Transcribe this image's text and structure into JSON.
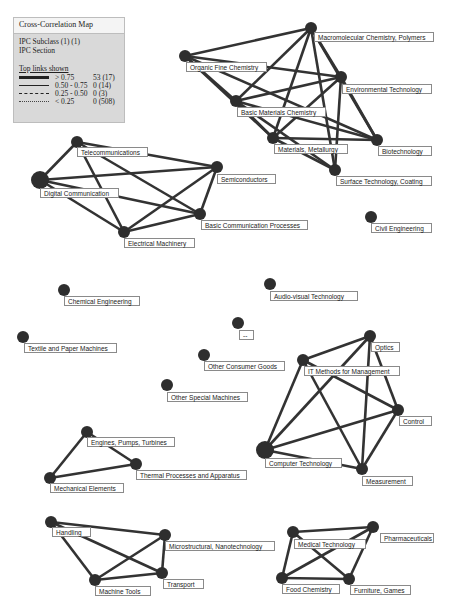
{
  "legend": {
    "title": "Cross-Correlation Map",
    "line1": "IPC Subclass (1) (1)",
    "line2": "IPC Section",
    "top_links_label": "Top links shown",
    "rows": [
      {
        "range": "> 0.75",
        "count": "53 (17)",
        "style": "thick"
      },
      {
        "range": "0.50 - 0.75",
        "count": "0 (14)",
        "style": "thin"
      },
      {
        "range": "0.25 - 0.50",
        "count": "0 (3)",
        "style": "dashed"
      },
      {
        "range": "< 0.25",
        "count": "0 (508)",
        "style": "dotted"
      }
    ]
  },
  "colors": {
    "node": "#2e2e2e",
    "edge": "#333333",
    "background": "#ffffff"
  },
  "nodes": [
    {
      "id": "macro",
      "label": "Macromolecular Chemistry, Polymers",
      "x": 311,
      "y": 28,
      "r": 6,
      "lx": 314,
      "ly": 32,
      "lw": 120
    },
    {
      "id": "organic",
      "label": "Organic Fine Chemistry",
      "x": 185,
      "y": 56,
      "r": 6,
      "lx": 186,
      "ly": 62,
      "lw": 81
    },
    {
      "id": "env",
      "label": "Environmental Technology",
      "x": 341,
      "y": 77,
      "r": 6,
      "lx": 342,
      "ly": 84,
      "lw": 90
    },
    {
      "id": "basicmat",
      "label": "Basic Materials Chemistry",
      "x": 236,
      "y": 101,
      "r": 6,
      "lx": 237,
      "ly": 107,
      "lw": 89
    },
    {
      "id": "metal",
      "label": "Materials, Metallurgy",
      "x": 273,
      "y": 138,
      "r": 6,
      "lx": 274,
      "ly": 144,
      "lw": 74
    },
    {
      "id": "biotech",
      "label": "Biotechnology",
      "x": 377,
      "y": 140,
      "r": 6,
      "lx": 378,
      "ly": 146,
      "lw": 54
    },
    {
      "id": "surface",
      "label": "Surface Technology, Coating",
      "x": 335,
      "y": 170,
      "r": 6,
      "lx": 336,
      "ly": 176,
      "lw": 96
    },
    {
      "id": "telecom",
      "label": "Telecommunications",
      "x": 77,
      "y": 142,
      "r": 6,
      "lx": 77,
      "ly": 147,
      "lw": 71
    },
    {
      "id": "digital",
      "label": "Digital Communication",
      "x": 40,
      "y": 180,
      "r": 9,
      "lx": 40,
      "ly": 188,
      "lw": 79
    },
    {
      "id": "semi",
      "label": "Semiconductors",
      "x": 217,
      "y": 167,
      "r": 6,
      "lx": 217,
      "ly": 174,
      "lw": 59
    },
    {
      "id": "basiccomm",
      "label": "Basic Communication Processes",
      "x": 200,
      "y": 214,
      "r": 6,
      "lx": 201,
      "ly": 220,
      "lw": 107
    },
    {
      "id": "elec",
      "label": "Electrical Machinery",
      "x": 124,
      "y": 232,
      "r": 6,
      "lx": 124,
      "ly": 238,
      "lw": 71
    },
    {
      "id": "civil",
      "label": "Civil Engineering",
      "x": 371,
      "y": 217,
      "r": 6,
      "lx": 371,
      "ly": 223,
      "lw": 61
    },
    {
      "id": "chem",
      "label": "Chemical Engineering",
      "x": 64,
      "y": 290,
      "r": 6,
      "lx": 64,
      "ly": 296,
      "lw": 76
    },
    {
      "id": "av",
      "label": "Audio-visual Technology",
      "x": 270,
      "y": 284,
      "r": 6,
      "lx": 270,
      "ly": 291,
      "lw": 88
    },
    {
      "id": "dash",
      "label": "--",
      "x": 238,
      "y": 323,
      "r": 6,
      "lx": 239,
      "ly": 330,
      "lw": 15
    },
    {
      "id": "textile",
      "label": "Textile and Paper Machines",
      "x": 23,
      "y": 337,
      "r": 6,
      "lx": 24,
      "ly": 343,
      "lw": 93
    },
    {
      "id": "optics",
      "label": "Optics",
      "x": 370,
      "y": 336,
      "r": 6,
      "lx": 371,
      "ly": 342,
      "lw": 29
    },
    {
      "id": "consumer",
      "label": "Other Consumer Goods",
      "x": 204,
      "y": 355,
      "r": 6,
      "lx": 204,
      "ly": 361,
      "lw": 81
    },
    {
      "id": "itmeth",
      "label": "IT Methods for Management",
      "x": 303,
      "y": 360,
      "r": 6,
      "lx": 304,
      "ly": 366,
      "lw": 96
    },
    {
      "id": "special",
      "label": "Other Special Machines",
      "x": 167,
      "y": 385,
      "r": 6,
      "lx": 167,
      "ly": 392,
      "lw": 81
    },
    {
      "id": "control",
      "label": "Control",
      "x": 398,
      "y": 410,
      "r": 6,
      "lx": 399,
      "ly": 416,
      "lw": 33
    },
    {
      "id": "engines",
      "label": "Engines, Pumps, Turbines",
      "x": 87,
      "y": 432,
      "r": 6,
      "lx": 87,
      "ly": 437,
      "lw": 88
    },
    {
      "id": "computer",
      "label": "Computer Technology",
      "x": 265,
      "y": 450,
      "r": 9,
      "lx": 265,
      "ly": 458,
      "lw": 77
    },
    {
      "id": "thermal",
      "label": "Thermal Processes and Apparatus",
      "x": 136,
      "y": 464,
      "r": 6,
      "lx": 136,
      "ly": 470,
      "lw": 111
    },
    {
      "id": "measure",
      "label": "Measurement",
      "x": 362,
      "y": 469,
      "r": 6,
      "lx": 362,
      "ly": 476,
      "lw": 51
    },
    {
      "id": "mech",
      "label": "Mechanical Elements",
      "x": 50,
      "y": 478,
      "r": 6,
      "lx": 50,
      "ly": 483,
      "lw": 74
    },
    {
      "id": "handling",
      "label": "Handling",
      "x": 51,
      "y": 522,
      "r": 6,
      "lx": 52,
      "ly": 527,
      "lw": 39
    },
    {
      "id": "pharma",
      "label": "Pharmaceuticals",
      "x": 373,
      "y": 527,
      "r": 6,
      "lx": 380,
      "ly": 533,
      "lw": 54
    },
    {
      "id": "medical",
      "label": "Medical Technology",
      "x": 293,
      "y": 532,
      "r": 6,
      "lx": 294,
      "ly": 539,
      "lw": 72
    },
    {
      "id": "micro",
      "label": "Microstructural, Nanotechnology",
      "x": 165,
      "y": 535,
      "r": 6,
      "lx": 165,
      "ly": 541,
      "lw": 110
    },
    {
      "id": "transport",
      "label": "Transport",
      "x": 162,
      "y": 573,
      "r": 6,
      "lx": 163,
      "ly": 579,
      "lw": 41
    },
    {
      "id": "food",
      "label": "Food Chemistry",
      "x": 282,
      "y": 578,
      "r": 6,
      "lx": 282,
      "ly": 584,
      "lw": 58
    },
    {
      "id": "furniture",
      "label": "Furniture, Games",
      "x": 349,
      "y": 579,
      "r": 6,
      "lx": 350,
      "ly": 585,
      "lw": 61
    },
    {
      "id": "machtools",
      "label": "Machine Tools",
      "x": 95,
      "y": 580,
      "r": 6,
      "lx": 95,
      "ly": 586,
      "lw": 56
    }
  ],
  "edges": [
    [
      "macro",
      "organic"
    ],
    [
      "macro",
      "basicmat"
    ],
    [
      "macro",
      "metal"
    ],
    [
      "macro",
      "env"
    ],
    [
      "macro",
      "biotech"
    ],
    [
      "macro",
      "surface"
    ],
    [
      "organic",
      "basicmat"
    ],
    [
      "organic",
      "env"
    ],
    [
      "organic",
      "metal"
    ],
    [
      "organic",
      "biotech"
    ],
    [
      "env",
      "basicmat"
    ],
    [
      "env",
      "metal"
    ],
    [
      "env",
      "biotech"
    ],
    [
      "env",
      "surface"
    ],
    [
      "basicmat",
      "metal"
    ],
    [
      "basicmat",
      "biotech"
    ],
    [
      "basicmat",
      "surface"
    ],
    [
      "metal",
      "biotech"
    ],
    [
      "metal",
      "surface"
    ],
    [
      "telecom",
      "digital"
    ],
    [
      "telecom",
      "semi"
    ],
    [
      "telecom",
      "basiccomm"
    ],
    [
      "telecom",
      "elec"
    ],
    [
      "digital",
      "semi"
    ],
    [
      "digital",
      "basiccomm"
    ],
    [
      "digital",
      "elec"
    ],
    [
      "semi",
      "basiccomm"
    ],
    [
      "semi",
      "elec"
    ],
    [
      "basiccomm",
      "elec"
    ],
    [
      "optics",
      "itmeth"
    ],
    [
      "optics",
      "computer"
    ],
    [
      "optics",
      "control"
    ],
    [
      "optics",
      "measure"
    ],
    [
      "itmeth",
      "computer"
    ],
    [
      "itmeth",
      "control"
    ],
    [
      "itmeth",
      "measure"
    ],
    [
      "computer",
      "control"
    ],
    [
      "computer",
      "measure"
    ],
    [
      "control",
      "measure"
    ],
    [
      "engines",
      "thermal"
    ],
    [
      "engines",
      "mech"
    ],
    [
      "thermal",
      "mech"
    ],
    [
      "handling",
      "micro"
    ],
    [
      "handling",
      "transport"
    ],
    [
      "handling",
      "machtools"
    ],
    [
      "micro",
      "transport"
    ],
    [
      "micro",
      "machtools"
    ],
    [
      "transport",
      "machtools"
    ],
    [
      "medical",
      "pharma"
    ],
    [
      "medical",
      "food"
    ],
    [
      "medical",
      "furniture"
    ],
    [
      "pharma",
      "food"
    ],
    [
      "pharma",
      "furniture"
    ],
    [
      "food",
      "furniture"
    ]
  ]
}
